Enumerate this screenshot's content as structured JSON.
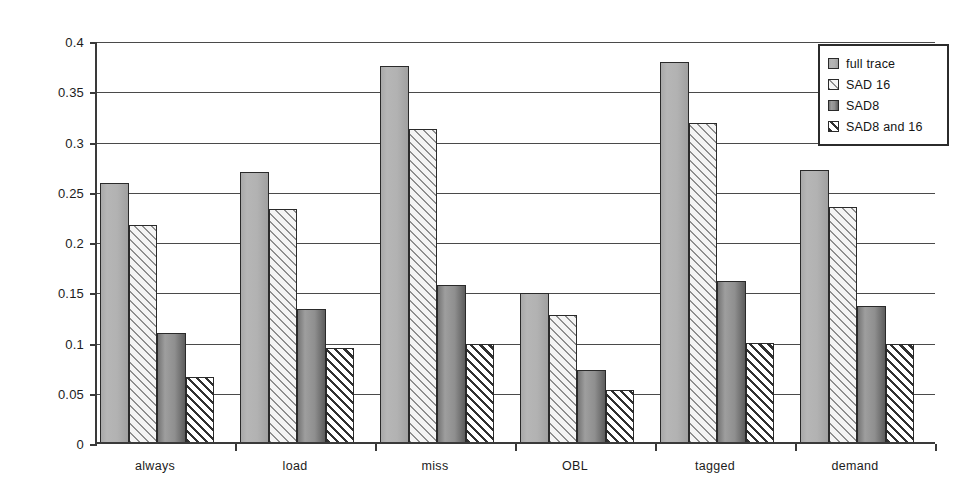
{
  "chart_data": {
    "type": "bar",
    "title": "",
    "xlabel": "",
    "ylabel": "",
    "ylim": [
      0,
      0.4
    ],
    "ytick_labels": [
      "0.4",
      "0.35",
      "0.3",
      "0.25",
      "0.2",
      "0.15",
      "0.1",
      "0.05",
      "0"
    ],
    "ytick_values": [
      0.4,
      0.35,
      0.3,
      0.25,
      0.2,
      0.15,
      0.1,
      0.05,
      0
    ],
    "grid": true,
    "legend_position": "top-right",
    "categories": [
      "always",
      "load",
      "miss",
      "OBL",
      "tagged",
      "demand"
    ],
    "series": [
      {
        "name": "full trace",
        "swatch": "solid-gray",
        "color": "#b0b0b0",
        "values": [
          0.258,
          0.269,
          0.374,
          0.148,
          0.378,
          0.271
        ]
      },
      {
        "name": "SAD 16",
        "swatch": "light-diagonal-hatch",
        "color": "#f4f4f4",
        "values": [
          0.216,
          0.232,
          0.311,
          0.126,
          0.317,
          0.234
        ]
      },
      {
        "name": "SAD8",
        "swatch": "dark-gray",
        "color": "#8a8a8a",
        "values": [
          0.108,
          0.132,
          0.156,
          0.072,
          0.16,
          0.135
        ]
      },
      {
        "name": "SAD8 and 16",
        "swatch": "dark-diagonal-hatch",
        "color": "#303030",
        "values": [
          0.065,
          0.094,
          0.098,
          0.052,
          0.099,
          0.098
        ]
      }
    ]
  },
  "axes": {
    "axis_color": "#3a3a3a",
    "grid_color": "#4a4a4a"
  }
}
